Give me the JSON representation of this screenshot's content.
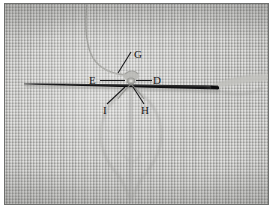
{
  "figure": {
    "kind": "photograph",
    "background_color": "#ffffff",
    "plate": {
      "fabric_color": "#b5b5b2",
      "border_color": "#6e6f6d",
      "x": 4,
      "y": 3,
      "width": 265,
      "height": 202
    }
  },
  "photo_features": {
    "needle": {
      "name": "needle",
      "color": "#17171a",
      "tip_x": 23,
      "tip_y": 80,
      "end_x": 216,
      "end_y": 85,
      "max_thickness": 3.0
    },
    "needle_shine": {
      "name": "needle-highlight",
      "color": "#d6d6d2"
    },
    "thread_upper": {
      "name": "thread-upper-curve",
      "color": "#9a9a97",
      "from_x": 86,
      "from_y": 4,
      "to_x": 124,
      "to_y": 72
    },
    "thread_right": {
      "name": "thread-right-tail",
      "color": "#a7a7a3",
      "from_x": 214,
      "from_y": 82,
      "to_x": 265,
      "to_y": 72
    },
    "knot": {
      "name": "knot",
      "center_x": 126,
      "center_y": 78,
      "color": "#8f8f8c"
    },
    "fabric_pucker": {
      "name": "fabric-pucker-crease",
      "color": "#9d9d9a",
      "apex_x": 128,
      "apex_y": 86,
      "bottom_x": 128,
      "bottom_y": 196
    }
  },
  "annotations": {
    "leader_color": "#1a1a1c",
    "label_color": "#18181a",
    "labels": [
      {
        "id": "G",
        "text": "G",
        "label_x": 134,
        "label_y": 54,
        "leader_from_x": 130,
        "leader_from_y": 50,
        "leader_to_x": 118,
        "leader_to_y": 70,
        "points_to": "thread loop above knot"
      },
      {
        "id": "E",
        "text": "E",
        "label_x": 92,
        "label_y": 80,
        "leader_from_x": 99,
        "leader_from_y": 77,
        "leader_to_x": 121,
        "leader_to_y": 77,
        "points_to": "fabric left of knot"
      },
      {
        "id": "D",
        "text": "D",
        "label_x": 152,
        "label_y": 80,
        "leader_from_x": 150,
        "leader_from_y": 77,
        "leader_to_x": 131,
        "leader_to_y": 77,
        "points_to": "fabric right of knot"
      },
      {
        "id": "I",
        "text": "I",
        "label_x": 104,
        "label_y": 110,
        "leader_from_x": 107,
        "leader_from_y": 101,
        "leader_to_x": 122,
        "leader_to_y": 84,
        "points_to": "thread exit below left of knot"
      },
      {
        "id": "H",
        "text": "H",
        "label_x": 142,
        "label_y": 110,
        "leader_from_x": 143,
        "leader_from_y": 101,
        "leader_to_x": 130,
        "leader_to_y": 84,
        "points_to": "thread exit below right of knot"
      }
    ]
  }
}
